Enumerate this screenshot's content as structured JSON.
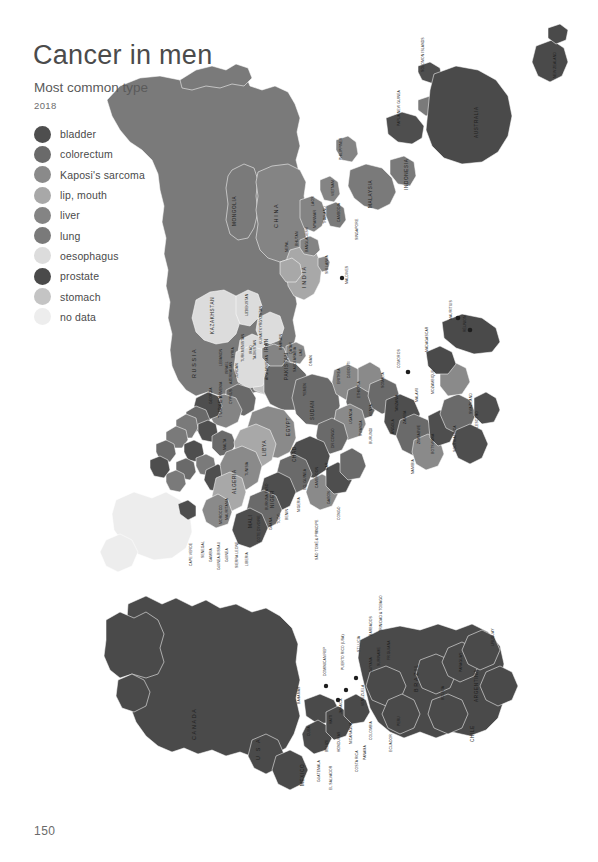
{
  "header": {
    "title": "Cancer in men",
    "subtitle": "Most common type",
    "year": "2018"
  },
  "page_number": "150",
  "legend": {
    "items": [
      {
        "label": "bladder",
        "color": "#4e4e4e"
      },
      {
        "label": "colorectum",
        "color": "#6a6a6a"
      },
      {
        "label": "Kaposi's sarcoma",
        "color": "#8a8a8a"
      },
      {
        "label": "lip, mouth",
        "color": "#a8a8a8"
      },
      {
        "label": "liver",
        "color": "#848484"
      },
      {
        "label": "lung",
        "color": "#7a7a7a"
      },
      {
        "label": "oesophagus",
        "color": "#dcdcdc"
      },
      {
        "label": "prostate",
        "color": "#4a4a4a"
      },
      {
        "label": "stomach",
        "color": "#c4c4c4"
      },
      {
        "label": "no data",
        "color": "#ededed"
      }
    ]
  },
  "map": {
    "type": "choropleth-world-map",
    "orientation": "rotated-90-clockwise",
    "projection_note": "world map printed sideways on the page",
    "colors": {
      "bladder": "#4e4e4e",
      "colorectum": "#6a6a6a",
      "kaposis_sarcoma": "#8a8a8a",
      "lip_mouth": "#a8a8a8",
      "liver": "#848484",
      "lung": "#7a7a7a",
      "oesophagus": "#dcdcdc",
      "prostate": "#4a4a4a",
      "stomach": "#c4c4c4",
      "no_data": "#ededed"
    },
    "labels": [
      {
        "text": "RUSSIA",
        "size": "big"
      },
      {
        "text": "MONGOLIA",
        "size": "mid"
      },
      {
        "text": "CHINA",
        "size": "big"
      },
      {
        "text": "KAZAKHSTAN",
        "size": "mid"
      },
      {
        "text": "UZBEKISTAN",
        "size": "sm"
      },
      {
        "text": "KYRGYZSTAN",
        "size": "sm"
      },
      {
        "text": "TAJIKISTAN",
        "size": "sm"
      },
      {
        "text": "TURKMENISTAN",
        "size": "sm"
      },
      {
        "text": "AZERBAIJAN",
        "size": "sm"
      },
      {
        "text": "ARMENIA",
        "size": "sm"
      },
      {
        "text": "GEORGIA",
        "size": "sm"
      },
      {
        "text": "AFGHANISTAN",
        "size": "sm"
      },
      {
        "text": "PAKISTAN",
        "size": "mid"
      },
      {
        "text": "IRAN",
        "size": "mid"
      },
      {
        "text": "IRAQ",
        "size": "sm"
      },
      {
        "text": "KUWAIT",
        "size": "sm"
      },
      {
        "text": "SAUDI ARABIA",
        "size": "sm"
      },
      {
        "text": "BAHRAIN",
        "size": "sm"
      },
      {
        "text": "QATAR",
        "size": "sm"
      },
      {
        "text": "UAE",
        "size": "sm"
      },
      {
        "text": "OMAN",
        "size": "sm"
      },
      {
        "text": "YEMEN",
        "size": "sm"
      },
      {
        "text": "JORDAN",
        "size": "sm"
      },
      {
        "text": "ISRAEL",
        "size": "sm"
      },
      {
        "text": "LEBANON",
        "size": "sm"
      },
      {
        "text": "SYRIA",
        "size": "sm"
      },
      {
        "text": "TURKEY",
        "size": "mid"
      },
      {
        "text": "CYPRUS",
        "size": "sm"
      },
      {
        "text": "MALTA",
        "size": "sm"
      },
      {
        "text": "INDIA",
        "size": "big"
      },
      {
        "text": "NEPAL",
        "size": "sm"
      },
      {
        "text": "BHUTAN",
        "size": "sm"
      },
      {
        "text": "BANGLADESH",
        "size": "sm"
      },
      {
        "text": "SRI LANKA",
        "size": "sm"
      },
      {
        "text": "MALDIVES",
        "size": "sm"
      },
      {
        "text": "MYANMAR",
        "size": "sm"
      },
      {
        "text": "THAILAND",
        "size": "sm"
      },
      {
        "text": "LAOS",
        "size": "sm"
      },
      {
        "text": "VIETNAM",
        "size": "sm"
      },
      {
        "text": "CAMBODIA",
        "size": "sm"
      },
      {
        "text": "MALAYSIA",
        "size": "mid"
      },
      {
        "text": "SINGAPORE",
        "size": "sm"
      },
      {
        "text": "INDONESIA",
        "size": "mid"
      },
      {
        "text": "PHILIPPINES",
        "size": "sm"
      },
      {
        "text": "PAPUA NEW GUINEA",
        "size": "sm"
      },
      {
        "text": "SOLOMON ISLANDS",
        "size": "sm"
      },
      {
        "text": "AUSTRALIA",
        "size": "mid"
      },
      {
        "text": "NEW ZEALAND",
        "size": "sm"
      },
      {
        "text": "EGYPT",
        "size": "mid"
      },
      {
        "text": "LIBYA",
        "size": "mid"
      },
      {
        "text": "ALGERIA",
        "size": "mid"
      },
      {
        "text": "MOROCCO",
        "size": "sm"
      },
      {
        "text": "TUNISIA",
        "size": "sm"
      },
      {
        "text": "MALI",
        "size": "mid"
      },
      {
        "text": "NIGER",
        "size": "mid"
      },
      {
        "text": "CHAD",
        "size": "mid"
      },
      {
        "text": "SUDAN",
        "size": "mid"
      },
      {
        "text": "ERITREA",
        "size": "sm"
      },
      {
        "text": "DJIBOUTI",
        "size": "sm"
      },
      {
        "text": "ETHIOPIA",
        "size": "sm"
      },
      {
        "text": "SOMALIA",
        "size": "sm"
      },
      {
        "text": "KENYA",
        "size": "sm"
      },
      {
        "text": "UGANDA",
        "size": "sm"
      },
      {
        "text": "RWANDA",
        "size": "sm"
      },
      {
        "text": "BURUNDI",
        "size": "sm"
      },
      {
        "text": "TANZANIA",
        "size": "sm"
      },
      {
        "text": "DR CONGO",
        "size": "sm"
      },
      {
        "text": "CAR",
        "size": "sm"
      },
      {
        "text": "CAMEROON",
        "size": "sm"
      },
      {
        "text": "NIGERIA",
        "size": "sm"
      },
      {
        "text": "BENIN",
        "size": "sm"
      },
      {
        "text": "TOGO",
        "size": "sm"
      },
      {
        "text": "GHANA",
        "size": "sm"
      },
      {
        "text": "BURKINA FASO",
        "size": "sm"
      },
      {
        "text": "COTE D'IVOIRE",
        "size": "sm"
      },
      {
        "text": "LIBERIA",
        "size": "sm"
      },
      {
        "text": "SIERRA LEONE",
        "size": "sm"
      },
      {
        "text": "GUINEA",
        "size": "sm"
      },
      {
        "text": "GUINEA-BISSAU",
        "size": "sm"
      },
      {
        "text": "GAMBIA",
        "size": "sm"
      },
      {
        "text": "SENEGAL",
        "size": "sm"
      },
      {
        "text": "CAPE VERDE",
        "size": "sm"
      },
      {
        "text": "MAURITANIA",
        "size": "sm"
      },
      {
        "text": "GABON",
        "size": "sm"
      },
      {
        "text": "CONGO",
        "size": "sm"
      },
      {
        "text": "SAO TOME & PRINCIPE",
        "size": "sm"
      },
      {
        "text": "EQ. GUINEA",
        "size": "sm"
      },
      {
        "text": "ANGOLA",
        "size": "sm"
      },
      {
        "text": "ZAMBIA",
        "size": "sm"
      },
      {
        "text": "MALAWI",
        "size": "sm"
      },
      {
        "text": "MOZAMBIQUE",
        "size": "sm"
      },
      {
        "text": "ZIMBABWE",
        "size": "sm"
      },
      {
        "text": "BOTSWANA",
        "size": "sm"
      },
      {
        "text": "NAMIBIA",
        "size": "sm"
      },
      {
        "text": "SOUTH AFRICA",
        "size": "sm"
      },
      {
        "text": "LESOTHO",
        "size": "sm"
      },
      {
        "text": "SWAZILAND",
        "size": "sm"
      },
      {
        "text": "MADAGASCAR",
        "size": "sm"
      },
      {
        "text": "COMOROS",
        "size": "sm"
      },
      {
        "text": "MAURITIUS",
        "size": "sm"
      },
      {
        "text": "REUNION",
        "size": "sm"
      },
      {
        "text": "CANADA",
        "size": "big"
      },
      {
        "text": "U S A",
        "size": "big"
      },
      {
        "text": "MEXICO",
        "size": "mid"
      },
      {
        "text": "CUBA",
        "size": "sm"
      },
      {
        "text": "BAHAMAS",
        "size": "sm"
      },
      {
        "text": "JAMAICA",
        "size": "sm"
      },
      {
        "text": "HAITI",
        "size": "sm"
      },
      {
        "text": "DOMINICAN REP",
        "size": "sm"
      },
      {
        "text": "PUERTO RICO (USA)",
        "size": "sm"
      },
      {
        "text": "ST LUCIA",
        "size": "sm"
      },
      {
        "text": "BARBADOS",
        "size": "sm"
      },
      {
        "text": "TRINIDAD & TOBAGO",
        "size": "sm"
      },
      {
        "text": "BELIZE",
        "size": "sm"
      },
      {
        "text": "GUATEMALA",
        "size": "sm"
      },
      {
        "text": "HONDURAS",
        "size": "sm"
      },
      {
        "text": "EL SALVADOR",
        "size": "sm"
      },
      {
        "text": "NICARAGUA",
        "size": "sm"
      },
      {
        "text": "COSTA RICA",
        "size": "sm"
      },
      {
        "text": "PANAMA",
        "size": "sm"
      },
      {
        "text": "COLOMBIA",
        "size": "sm"
      },
      {
        "text": "VENEZUELA",
        "size": "sm"
      },
      {
        "text": "GUYANA",
        "size": "sm"
      },
      {
        "text": "SURINAME",
        "size": "sm"
      },
      {
        "text": "FR GUIANA",
        "size": "sm"
      },
      {
        "text": "ECUADOR",
        "size": "sm"
      },
      {
        "text": "PERU",
        "size": "sm"
      },
      {
        "text": "BRAZIL",
        "size": "big"
      },
      {
        "text": "BOLIVIA",
        "size": "sm"
      },
      {
        "text": "PARAGUAY",
        "size": "sm"
      },
      {
        "text": "URUGUAY",
        "size": "sm"
      },
      {
        "text": "ARGENTINA",
        "size": "mid"
      },
      {
        "text": "CHILE",
        "size": "mid"
      }
    ]
  }
}
